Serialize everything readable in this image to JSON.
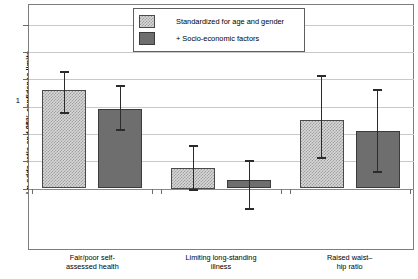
{
  "chart_data": {
    "type": "bar",
    "title": "",
    "subtitle": "",
    "xlabel": "",
    "ylabel": "Ln odds ratio and 95% confidence limits",
    "categories": [
      "Fair/poor self-\nassessed health",
      "Limiting long-standing\nillness",
      "Raised waist–\nhip ratio"
    ],
    "category_lines": [
      [
        "Fair/poor self-",
        "assessed health"
      ],
      [
        "Limiting long-standing",
        "illness"
      ],
      [
        "Raised waist–",
        "hip ratio"
      ]
    ],
    "ylim": [
      -0.45,
      1.35
    ],
    "ytick_values": [
      0,
      0.2,
      0.4,
      0.6,
      0.8,
      1.0,
      1.2
    ],
    "ytick_labels": [
      "0",
      "",
      "",
      "",
      "",
      "1",
      ""
    ],
    "grid": true,
    "legend_position": "top-center",
    "series": [
      {
        "name": "Standardized for age and gender",
        "style": "light-checkered",
        "color": "#d8d8d8",
        "values": [
          0.72,
          0.15,
          0.5
        ],
        "ci_low": [
          0.55,
          -0.01,
          0.22
        ],
        "ci_high": [
          0.85,
          0.31,
          0.82
        ]
      },
      {
        "name": "+ Socio-economic factors",
        "style": "solid-gray",
        "color": "#6e6e6e",
        "values": [
          0.58,
          0.065,
          0.42
        ],
        "ci_low": [
          0.43,
          -0.15,
          0.12
        ],
        "ci_high": [
          0.75,
          0.2,
          0.72
        ]
      }
    ]
  },
  "legend": {
    "items": [
      {
        "label": "Standardized for age and gender"
      },
      {
        "label": "+ Socio-economic factors"
      }
    ]
  },
  "axes": {
    "y_title": "Ln odds ratio and 95% confidence limits",
    "y_labels": {
      "one": "1",
      "zero": "0"
    }
  },
  "colors": {
    "light_bar": "#d8d8d8",
    "dark_bar": "#6e6e6e",
    "gridline": "#c9c9c9",
    "axis": "#7d7d7d",
    "error_bar": "#2b2b2b"
  }
}
